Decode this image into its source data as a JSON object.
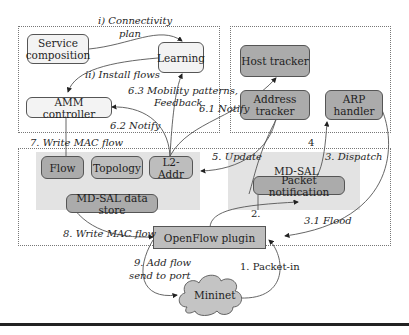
{
  "diagram": {
    "top_left_group": {
      "service_composition": "Service composition",
      "learning": "Learning",
      "amm_controller": "AMM controller"
    },
    "top_right_group": {
      "host_tracker": "Host tracker",
      "address_tracker": "Address tracker",
      "arp_handler": "ARP handler"
    },
    "bottom_group": {
      "flow": "Flow",
      "topology": "Topology",
      "l2_addr": "L2-Addr",
      "md_sal_data_store": "MD-SAL data store",
      "md_sal_label": "MD-SAL",
      "packet_notification": "Packet notification",
      "openflow_plugin": "OpenFlow plugin"
    },
    "mininet": "Mininet",
    "labels": {
      "connectivity_plan_1": "i) Connectivity",
      "connectivity_plan_2": "plan",
      "install_flows": "ii) Install flows",
      "mobility_patterns": "6.3 Mobility patterns,",
      "feedback": "Feedback",
      "notify_61": "6.1 Notify",
      "notify_62": "6.2 Notify",
      "write_mac_flow_7": "7. Write MAC flow",
      "update_5": "5. Update",
      "step_4": "4",
      "dispatch_3": "3. Dispatch",
      "step_2": "2.",
      "flood_31": "3.1 Flood",
      "write_mac_flow_8": "8. Write MAC flow",
      "add_flow_9a": "9. Add flow",
      "add_flow_9b": "send to port",
      "packet_in_1": "1. Packet-in"
    }
  }
}
